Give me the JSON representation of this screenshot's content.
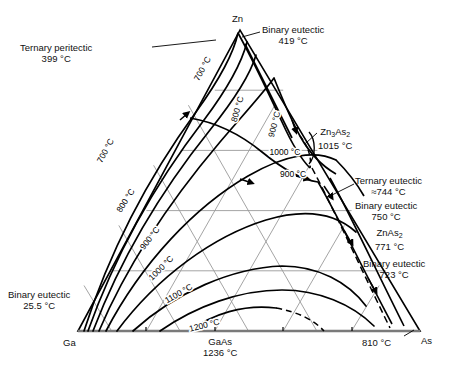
{
  "figure": {
    "type": "ternary-phase-diagram",
    "system": "Ga-Zn-As"
  },
  "vertices": {
    "left": {
      "label": "Ga",
      "x": 78,
      "y": 331
    },
    "right": {
      "label": "As",
      "x": 420,
      "y": 331
    },
    "top": {
      "label": "Zn",
      "x": 240,
      "y": 30
    }
  },
  "annotations": [
    {
      "name": "ternary-peritectic",
      "line1": "Ternary peritectic",
      "line2": "399 °C",
      "x": 20,
      "y": 42,
      "align": "left"
    },
    {
      "name": "binary-eutectic-zn",
      "line1": "Binary eutectic",
      "line2": "419 °C",
      "x": 262,
      "y": 24,
      "align": "left"
    },
    {
      "name": "zn3as2-compound",
      "line1": "Zn3As2",
      "line2": "1015 °C",
      "x": 318,
      "y": 126,
      "align": "left"
    },
    {
      "name": "ternary-eutectic",
      "line1": "Ternary eutectic",
      "line2": "≈744 °C",
      "x": 355,
      "y": 175,
      "align": "left"
    },
    {
      "name": "binary-eutectic-750",
      "line1": "Binary eutectic",
      "line2": "750 °C",
      "x": 355,
      "y": 200,
      "align": "left"
    },
    {
      "name": "znas2-compound",
      "line1": "ZnAs2",
      "line2": "771 °C",
      "x": 375,
      "y": 227,
      "align": "left"
    },
    {
      "name": "binary-eutectic-723",
      "line1": "Binary eutectic",
      "line2": "723 °C",
      "x": 363,
      "y": 258,
      "align": "left"
    },
    {
      "name": "binary-eutectic-ga",
      "line1": "Binary eutectic",
      "line2": "25.5 °C",
      "x": 8,
      "y": 289,
      "align": "left"
    },
    {
      "name": "gaas-compound",
      "line1": "GaAs",
      "line2": "1236 °C",
      "x": 203,
      "y": 336,
      "align": "left"
    },
    {
      "name": "as-edge-810",
      "line1": "810 °C",
      "line2": "",
      "x": 362,
      "y": 337,
      "align": "left"
    }
  ],
  "vertex_labels": [
    {
      "name": "vertex-label-zn",
      "text": "Zn",
      "x": 232,
      "y": 13
    },
    {
      "name": "vertex-label-ga",
      "text": "Ga",
      "x": 63,
      "y": 337
    },
    {
      "name": "vertex-label-as",
      "text": "As",
      "x": 421,
      "y": 335
    }
  ],
  "isotherm_labels": [
    {
      "name": "isotherm-700-upper",
      "text": "700 °C",
      "x": 205,
      "y": 70,
      "rot": 62
    },
    {
      "name": "isotherm-800-upper",
      "text": "800 °C",
      "x": 240,
      "y": 110,
      "rot": 74
    },
    {
      "name": "isotherm-900-upper",
      "text": "900 °C",
      "x": 277,
      "y": 125,
      "rot": 76
    },
    {
      "name": "isotherm-1000-right",
      "text": "1000 °C",
      "x": 285,
      "y": 155,
      "rot": 0
    },
    {
      "name": "isotherm-900-right",
      "text": "900 °C",
      "x": 293,
      "y": 177,
      "rot": 0
    },
    {
      "name": "isotherm-700-left",
      "text": "700 °C",
      "x": 108,
      "y": 152,
      "rot": 62
    },
    {
      "name": "isotherm-800-left",
      "text": "800 °C",
      "x": 128,
      "y": 202,
      "rot": 58
    },
    {
      "name": "isotherm-900-left",
      "text": "900 °C",
      "x": 152,
      "y": 240,
      "rot": 52
    },
    {
      "name": "isotherm-1000-left",
      "text": "1000 °C",
      "x": 163,
      "y": 270,
      "rot": 45
    },
    {
      "name": "isotherm-1100-left",
      "text": "1100 °C",
      "x": 180,
      "y": 296,
      "rot": 30
    },
    {
      "name": "isotherm-1200-left",
      "text": "1200 °C",
      "x": 205,
      "y": 328,
      "rot": 14
    }
  ],
  "chart_data": {
    "type": "ternary-contour",
    "components": [
      "Ga",
      "Zn",
      "As"
    ],
    "unit": "°C",
    "isotherms": [
      700,
      800,
      900,
      1000,
      1100,
      1200
    ],
    "grid": {
      "divisions": 5,
      "on": true
    },
    "invariant_points": [
      {
        "label": "Ternary peritectic",
        "temperature": 399
      },
      {
        "label": "Binary eutectic (Zn side)",
        "temperature": 419
      },
      {
        "label": "Zn3As2",
        "temperature": 1015
      },
      {
        "label": "Ternary eutectic",
        "temperature": 744,
        "approximate": true
      },
      {
        "label": "Binary eutectic",
        "temperature": 750
      },
      {
        "label": "ZnAs2",
        "temperature": 771
      },
      {
        "label": "Binary eutectic",
        "temperature": 723
      },
      {
        "label": "Binary eutectic (Ga side)",
        "temperature": 25.5
      },
      {
        "label": "GaAs",
        "temperature": 1236
      },
      {
        "label": "As edge",
        "temperature": 810
      }
    ]
  }
}
